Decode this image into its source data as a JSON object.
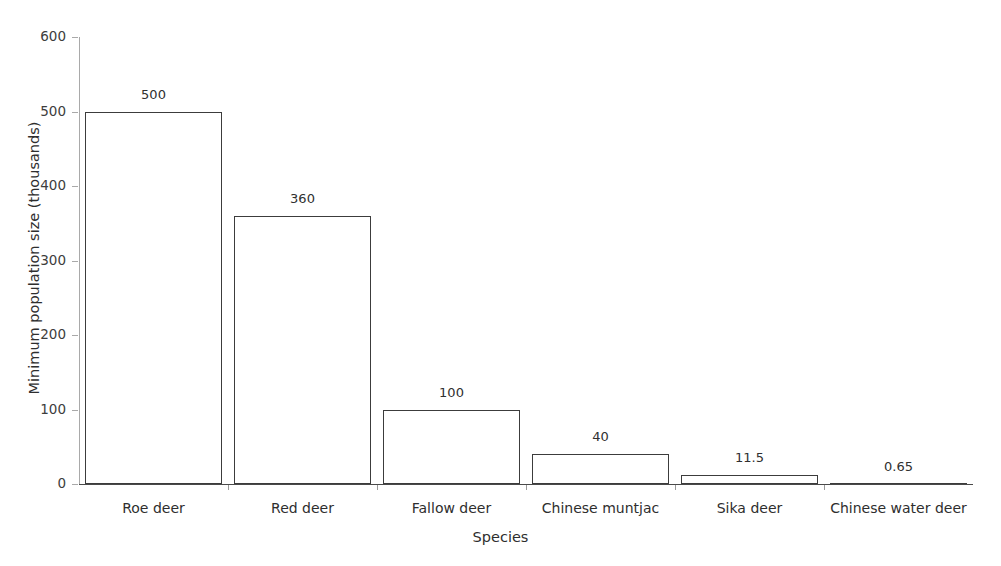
{
  "chart_data": {
    "type": "bar",
    "title": "",
    "xlabel": "Species",
    "ylabel": "Minimum population size (thousands)",
    "categories": [
      "Roe deer",
      "Red deer",
      "Fallow deer",
      "Chinese muntjac",
      "Sika deer",
      "Chinese water deer"
    ],
    "values": [
      500,
      360,
      100,
      40,
      11.5,
      0.65
    ],
    "value_labels": [
      "500",
      "360",
      "100",
      "40",
      "11.5",
      "0.65"
    ],
    "ylim": [
      0,
      600
    ],
    "yticks": [
      0,
      100,
      200,
      300,
      400,
      500,
      600
    ],
    "ytick_labels": [
      "0",
      "100",
      "200",
      "300",
      "400",
      "500",
      "600"
    ],
    "grid": false,
    "legend": false,
    "bar_fill_color": "#ffffff",
    "bar_edge_color": "#3c3c3c",
    "axis_color": "#4a4a4a",
    "text_color": "#2e2e2e"
  }
}
